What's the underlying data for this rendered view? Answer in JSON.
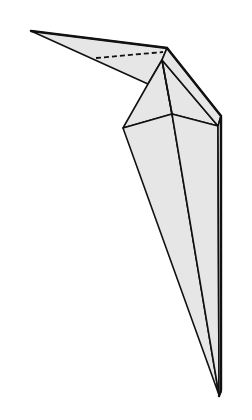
{
  "diagram": {
    "colors": {
      "paper": "#e6e6e6",
      "line": "#111111",
      "background": "#ffffff"
    },
    "annotations": {
      "valley_fold_line": "dashed line across head/beak"
    }
  }
}
